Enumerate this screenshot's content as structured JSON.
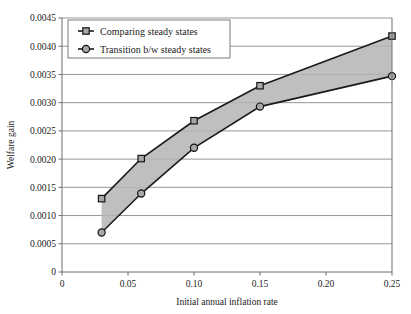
{
  "chart_data": {
    "type": "line",
    "title": "",
    "xlabel": "Initial annual inflation rate",
    "ylabel": "Welfare gain",
    "xlim": [
      0,
      0.25
    ],
    "ylim": [
      0,
      0.0045
    ],
    "grid": true,
    "legend_position": "top-left",
    "xticks": [
      "0",
      "0.05",
      "0.10",
      "0.15",
      "0.20",
      "0.25"
    ],
    "xtick_values": [
      0,
      0.05,
      0.1,
      0.15,
      0.2,
      0.25
    ],
    "yticks": [
      "0",
      "0.0005",
      "0.0010",
      "0.0015",
      "0.0020",
      "0.0025",
      "0.0030",
      "0.0035",
      "0.0040",
      "0.0045"
    ],
    "ytick_values": [
      0,
      0.0005,
      0.001,
      0.0015,
      0.002,
      0.0025,
      0.003,
      0.0035,
      0.004,
      0.0045
    ],
    "x": [
      0.03,
      0.06,
      0.1,
      0.15,
      0.25
    ],
    "series": [
      {
        "name": "Comparing steady states",
        "marker": "square",
        "values": [
          0.0013,
          0.00201,
          0.00268,
          0.0033,
          0.00418
        ]
      },
      {
        "name": "Transition b/w steady states",
        "marker": "circle",
        "values": [
          0.0007,
          0.00139,
          0.0022,
          0.00293,
          0.00347
        ]
      }
    ],
    "shaded_band": {
      "between": [
        "Comparing steady states",
        "Transition b/w steady states"
      ],
      "color": "#b4b4b4"
    }
  },
  "legend": {
    "items": [
      {
        "label": "Comparing steady states",
        "marker": "square-marker-icon"
      },
      {
        "label": "Transition b/w steady states",
        "marker": "circle-marker-icon"
      }
    ]
  },
  "colors": {
    "line": "#1a1a1a",
    "marker_fill": "#a8a8a8",
    "grid": "#8a8a8a",
    "band": "#b4b4b4",
    "background": "#ffffff"
  }
}
